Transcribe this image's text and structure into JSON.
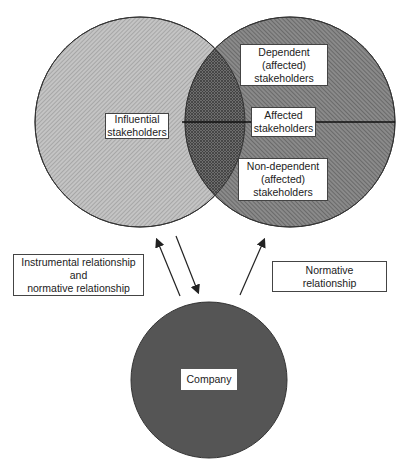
{
  "diagram": {
    "circles": {
      "influential": {
        "label_lines": [
          "Influential",
          "stakeholders"
        ]
      },
      "affected": {
        "top_label_lines": [
          "Dependent",
          "(affected)",
          "stakeholders"
        ],
        "middle_label_lines": [
          "Affected",
          "stakeholders"
        ],
        "bottom_label_lines": [
          "Non-dependent",
          "(affected)",
          "stakeholders"
        ]
      },
      "company": {
        "label": "Company"
      }
    },
    "relationships": {
      "left": {
        "label_lines": [
          "Instrumental relationship",
          "and",
          "normative relationship"
        ]
      },
      "right": {
        "label_lines": [
          "Normative",
          "relationship"
        ]
      }
    },
    "colors": {
      "influential_fill": "#bdbdbd",
      "affected_fill": "#7a7a7a",
      "overlap_fill": "#6a6a6a",
      "company_fill": "#555555",
      "stroke": "#222222"
    }
  }
}
